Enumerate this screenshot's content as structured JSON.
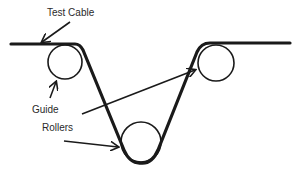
{
  "diagram": {
    "labels": {
      "test_cable": "Test Cable",
      "guide": "Guide",
      "rollers": "Rollers"
    },
    "colors": {
      "stroke": "#1a1a1a",
      "text": "#2a2a2a",
      "background": "#ffffff"
    },
    "rollers": [
      {
        "name": "left-guide-roller",
        "cx": 65,
        "cy": 62,
        "r": 17
      },
      {
        "name": "bottom-guide-roller",
        "cx": 141,
        "cy": 142,
        "r": 20
      },
      {
        "name": "right-guide-roller",
        "cx": 216,
        "cy": 63,
        "r": 18
      }
    ]
  }
}
